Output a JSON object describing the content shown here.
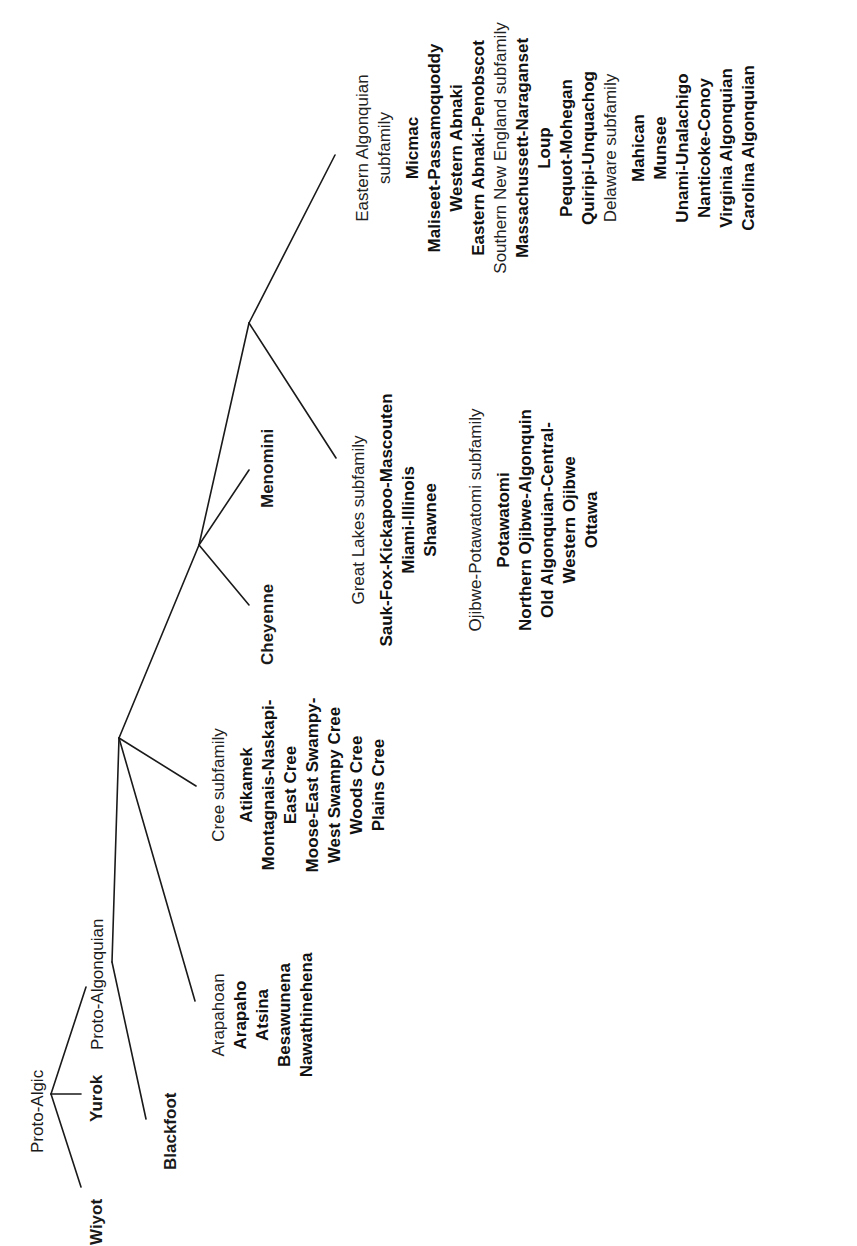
{
  "diagram": {
    "type": "language-family-tree",
    "orientation": "rotated-90-ccw",
    "line_color": "#1a1a1a",
    "root": "Proto-Algic",
    "nodes": {
      "proto_algic": {
        "label": "Proto-Algic"
      },
      "wiyot": {
        "label": "Wiyot"
      },
      "yurok": {
        "label": "Yurok"
      },
      "proto_algonquian": {
        "label": "Proto-Algonquian"
      },
      "blackfoot": {
        "label": "Blackfoot"
      },
      "cheyenne": {
        "label": "Cheyenne"
      },
      "menomini": {
        "label": "Menomini"
      }
    },
    "groups": {
      "arapahoan": {
        "header": "Arapahoan",
        "languages": [
          "Arapaho",
          "Atsina",
          "Besawunena",
          "Nawathinehena"
        ]
      },
      "cree": {
        "header": "Cree subfamily",
        "languages": [
          "Atikamek",
          "Montagnais-Naskapi-",
          "East Cree",
          "Moose-East Swampy-",
          "West Swampy Cree",
          "Woods Cree",
          "Plains Cree"
        ]
      },
      "great_lakes": {
        "header": "Great Lakes subfamily",
        "languages": [
          "Sauk-Fox-Kickapoo-Mascouten",
          "Miami-Illinois",
          "Shawnee"
        ]
      },
      "ojibwe_potawatomi": {
        "header": "Ojibwe-Potawatomi subfamily",
        "languages": [
          "Potawatomi",
          "Northern Ojibwe-Algonquin",
          "Old Algonquian-Central-",
          "Western Ojibwe",
          "Ottawa"
        ]
      },
      "eastern": {
        "header_line1": "Eastern Algonquian",
        "header_line2": "subfamily",
        "languages": [
          "Micmac",
          "Maliseet-Passamoquoddy",
          "Western Abnaki",
          "Eastern Abnaki-Penobscot"
        ]
      },
      "southern_new_england": {
        "header": "Southern New England subfamily",
        "languages": [
          "Massachussett-Naraganset",
          "Loup",
          "Pequot-Mohegan",
          "Quiripi-Unquachog"
        ]
      },
      "delaware": {
        "header": "Delaware subfamily",
        "languages": [
          "Mahican",
          "Munsee",
          "Unami-Unalachigo",
          "Nanticoke-Conoy",
          "Virginia Algonquian",
          "Carolina Algonquian"
        ]
      }
    }
  }
}
